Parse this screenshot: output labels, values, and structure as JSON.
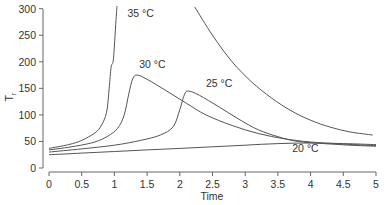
{
  "chart_data": {
    "type": "line",
    "title": "",
    "xlabel": "Time",
    "ylabel": "T_r",
    "xlim": [
      0,
      5
    ],
    "ylim": [
      0,
      300
    ],
    "x_ticks": [
      "0",
      "0.5",
      "1",
      "1.5",
      "2",
      "2.5",
      "3",
      "3.5",
      "4",
      "4.5",
      "5"
    ],
    "y_ticks": [
      "0",
      "50",
      "100",
      "150",
      "200",
      "250",
      "300"
    ],
    "grid": false,
    "legend": "inline labels",
    "series": [
      {
        "name": "35 °C",
        "label_pos": [
          1.2,
          285
        ],
        "points": [
          [
            0,
            37
          ],
          [
            0.3,
            44
          ],
          [
            0.5,
            52
          ],
          [
            0.7,
            66
          ],
          [
            0.8,
            80
          ],
          [
            0.88,
            105
          ],
          [
            0.92,
            150
          ],
          [
            0.95,
            190
          ],
          [
            0.98,
            200
          ],
          [
            1.0,
            230
          ],
          [
            1.02,
            270
          ],
          [
            1.04,
            305
          ]
        ],
        "points_tail": [
          [
            2.23,
            303
          ],
          [
            2.5,
            250
          ],
          [
            2.8,
            200
          ],
          [
            3.1,
            162
          ],
          [
            3.4,
            132
          ],
          [
            3.7,
            108
          ],
          [
            4.0,
            90
          ],
          [
            4.3,
            77
          ],
          [
            4.6,
            68
          ],
          [
            4.95,
            62
          ]
        ]
      },
      {
        "name": "30 °C",
        "label_pos": [
          1.38,
          188
        ],
        "points": [
          [
            0,
            34
          ],
          [
            0.4,
            41
          ],
          [
            0.7,
            49
          ],
          [
            0.9,
            60
          ],
          [
            1.05,
            75
          ],
          [
            1.15,
            100
          ],
          [
            1.22,
            140
          ],
          [
            1.28,
            168
          ],
          [
            1.35,
            175
          ],
          [
            1.5,
            167
          ],
          [
            1.8,
            145
          ],
          [
            2.1,
            122
          ],
          [
            2.4,
            100
          ],
          [
            2.8,
            80
          ],
          [
            3.2,
            65
          ],
          [
            3.6,
            55
          ],
          [
            4.0,
            49
          ],
          [
            4.5,
            45
          ],
          [
            5.0,
            42
          ]
        ]
      },
      {
        "name": "25 °C",
        "label_pos": [
          2.4,
          153
        ],
        "points": [
          [
            0,
            30
          ],
          [
            0.5,
            36
          ],
          [
            1.0,
            43
          ],
          [
            1.4,
            52
          ],
          [
            1.7,
            62
          ],
          [
            1.9,
            78
          ],
          [
            2.0,
            110
          ],
          [
            2.07,
            138
          ],
          [
            2.13,
            145
          ],
          [
            2.3,
            137
          ],
          [
            2.6,
            115
          ],
          [
            2.9,
            92
          ],
          [
            3.2,
            72
          ],
          [
            3.5,
            59
          ],
          [
            3.8,
            50
          ],
          [
            4.2,
            46
          ],
          [
            4.6,
            43
          ],
          [
            5.0,
            41
          ]
        ]
      },
      {
        "name": "20 °C",
        "label_pos": [
          3.72,
          30
        ],
        "points": [
          [
            0,
            25
          ],
          [
            0.5,
            28
          ],
          [
            1.0,
            31
          ],
          [
            1.5,
            34
          ],
          [
            2.0,
            37
          ],
          [
            2.5,
            40
          ],
          [
            3.0,
            43
          ],
          [
            3.5,
            46
          ],
          [
            4.0,
            47
          ],
          [
            4.5,
            46
          ],
          [
            5.0,
            44
          ]
        ]
      }
    ]
  }
}
